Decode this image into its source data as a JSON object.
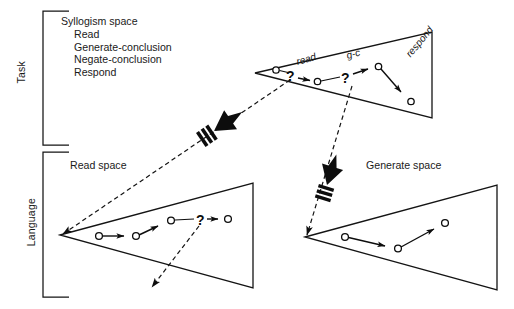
{
  "figure": {
    "background_color": "#ffffff",
    "line_color": "#141414"
  },
  "axis_labels": {
    "task": "Task",
    "language": "Language"
  },
  "task_space": {
    "heading": "Syllogism space",
    "operators": [
      "Read",
      "Generate-conclusion",
      "Negate-conclusion",
      "Respond"
    ]
  },
  "spaces": [
    {
      "name": "syllogism-space-triangle",
      "label": "",
      "level": "Task"
    },
    {
      "name": "read-space-triangle",
      "label": "Read space",
      "level": "Language"
    },
    {
      "name": "generate-space-triangle",
      "label": "Generate space",
      "level": "Language"
    }
  ],
  "read_space": {
    "label": "Read space"
  },
  "generate_space": {
    "label": "Generate space"
  },
  "operator_arcs": {
    "read": "read",
    "generate_conclusion": "g-c",
    "respond": "respond"
  },
  "question_marks": {
    "top_first": "?",
    "top_second": "?",
    "read_space": "?"
  },
  "icons": {
    "thick_arrow_read": "thick-striped-arrow-icon",
    "thick_arrow_generate": "thick-striped-arrow-icon",
    "node": "state-node-icon",
    "operator_arrow": "operator-arrow-icon",
    "impasse": "impasse-question-icon"
  }
}
